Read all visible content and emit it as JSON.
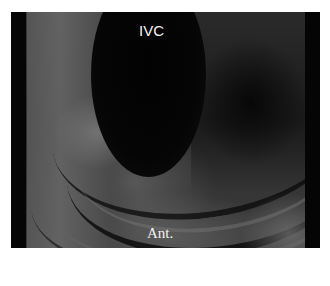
{
  "image": {
    "description": "Grayscale intravascular/intracardiac echo-style image showing a dark circular lumen with layered curved tissue walls",
    "colors": {
      "background": "#ffffff",
      "border_bands": "#050505",
      "lumen": "#030303",
      "label_text": "#f2f2f2"
    }
  },
  "labels": {
    "top": "IVC",
    "bottom": "Ant."
  }
}
